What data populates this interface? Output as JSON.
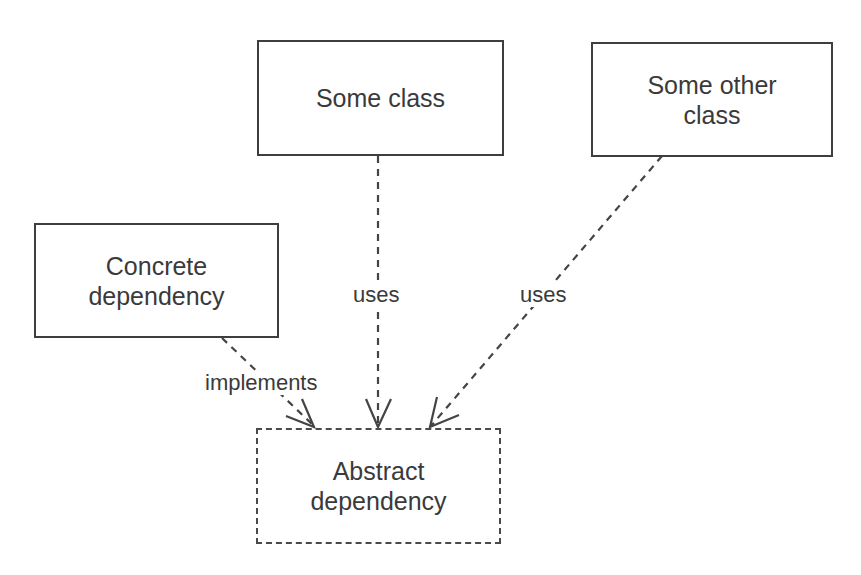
{
  "diagram": {
    "type": "dependency-inversion",
    "nodes": {
      "some_class": {
        "label": "Some class",
        "style": "solid"
      },
      "some_other_class": {
        "label": "Some other\nclass",
        "style": "solid"
      },
      "concrete_dependency": {
        "label": "Concrete\ndependency",
        "style": "solid"
      },
      "abstract_dependency": {
        "label": "Abstract\ndependency",
        "style": "dashed"
      }
    },
    "edges": [
      {
        "from": "some_class",
        "to": "abstract_dependency",
        "label": "uses",
        "line": "dashed",
        "arrow": "open"
      },
      {
        "from": "some_other_class",
        "to": "abstract_dependency",
        "label": "uses",
        "line": "dashed",
        "arrow": "open"
      },
      {
        "from": "concrete_dependency",
        "to": "abstract_dependency",
        "label": "implements",
        "line": "dashed",
        "arrow": "open"
      }
    ],
    "colors": {
      "stroke": "#3e3e3e",
      "text": "#3a3a3a",
      "background": "#ffffff"
    }
  }
}
